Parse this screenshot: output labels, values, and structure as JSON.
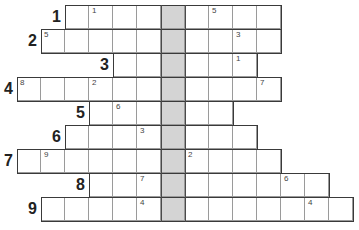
{
  "puzzle": {
    "type": "crossword-row-puzzle",
    "shaded_column": 6,
    "colors": {
      "shaded": "#d4d4d4",
      "border": "#3a3a3a",
      "grid_line": "#9a9a9a"
    },
    "rows": [
      {
        "label": "1",
        "start_col": 2,
        "end_col": 10,
        "numbers": [
          {
            "col": 3,
            "n": "1"
          },
          {
            "col": 8,
            "n": "5"
          }
        ]
      },
      {
        "label": "2",
        "start_col": 1,
        "end_col": 10,
        "numbers": [
          {
            "col": 1,
            "n": "5"
          },
          {
            "col": 9,
            "n": "3"
          }
        ]
      },
      {
        "label": "3",
        "start_col": 4,
        "end_col": 9,
        "numbers": [
          {
            "col": 9,
            "n": "1"
          }
        ]
      },
      {
        "label": "4",
        "start_col": 0,
        "end_col": 10,
        "numbers": [
          {
            "col": 0,
            "n": "8"
          },
          {
            "col": 3,
            "n": "2"
          },
          {
            "col": 10,
            "n": "7"
          }
        ]
      },
      {
        "label": "5",
        "start_col": 3,
        "end_col": 8,
        "numbers": [
          {
            "col": 4,
            "n": "6"
          }
        ]
      },
      {
        "label": "6",
        "start_col": 2,
        "end_col": 9,
        "numbers": [
          {
            "col": 5,
            "n": "3"
          }
        ]
      },
      {
        "label": "7",
        "start_col": 0,
        "end_col": 10,
        "numbers": [
          {
            "col": 1,
            "n": "9"
          },
          {
            "col": 7,
            "n": "2"
          }
        ]
      },
      {
        "label": "8",
        "start_col": 3,
        "end_col": 12,
        "numbers": [
          {
            "col": 5,
            "n": "7"
          },
          {
            "col": 11,
            "n": "6"
          }
        ]
      },
      {
        "label": "9",
        "start_col": 1,
        "end_col": 13,
        "numbers": [
          {
            "col": 5,
            "n": "4"
          },
          {
            "col": 12,
            "n": "4"
          }
        ]
      }
    ]
  }
}
